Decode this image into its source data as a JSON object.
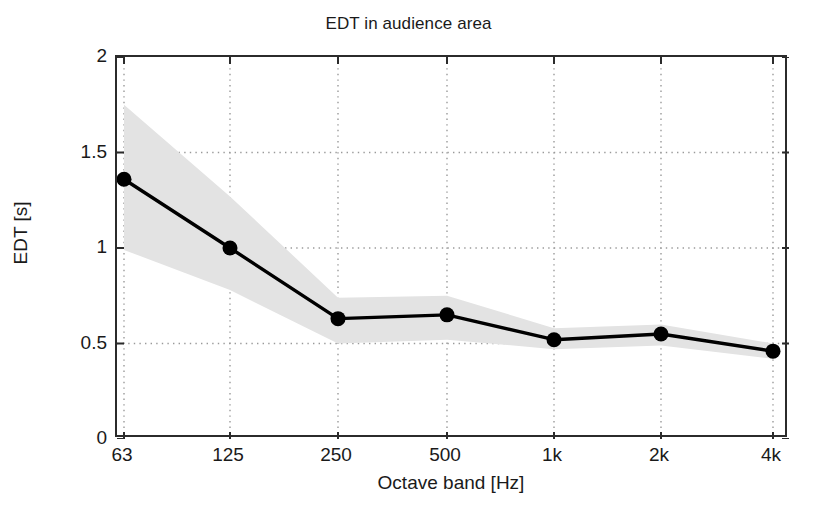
{
  "chart_data": {
    "type": "line",
    "title": "EDT in audience area",
    "xlabel": "Octave band [Hz]",
    "ylabel": "EDT [s]",
    "categories": [
      "63",
      "125",
      "250",
      "500",
      "1k",
      "2k",
      "4k"
    ],
    "x_tick_labels": [
      "63",
      "125",
      "250",
      "500",
      "1k",
      "2k",
      "4k"
    ],
    "y_tick_labels": [
      "2",
      "1.5",
      "1",
      "0.5",
      "0"
    ],
    "y_ticks": [
      2,
      1.5,
      1,
      0.5,
      0
    ],
    "ylim": [
      0,
      2
    ],
    "grid": "dotted-both",
    "legend": "none",
    "series": [
      {
        "name": "EDT mean",
        "style": "line-with-filled-circle-markers",
        "color": "#000000",
        "values": [
          1.36,
          1.0,
          0.63,
          0.65,
          0.52,
          0.55,
          0.46
        ]
      },
      {
        "name": "EDT spread band",
        "style": "shaded-area",
        "color": "#e3e3e3",
        "upper": [
          1.75,
          1.27,
          0.74,
          0.75,
          0.58,
          0.6,
          0.5
        ],
        "lower": [
          0.99,
          0.78,
          0.5,
          0.52,
          0.47,
          0.49,
          0.42
        ]
      }
    ]
  },
  "axes": {
    "title_fontsize": 17,
    "tick_fontsize": 19,
    "box_color": "#2b2b2b",
    "grid_color": "#9a9a9a",
    "band_color": "#e3e3e3",
    "line_color": "#000000"
  }
}
